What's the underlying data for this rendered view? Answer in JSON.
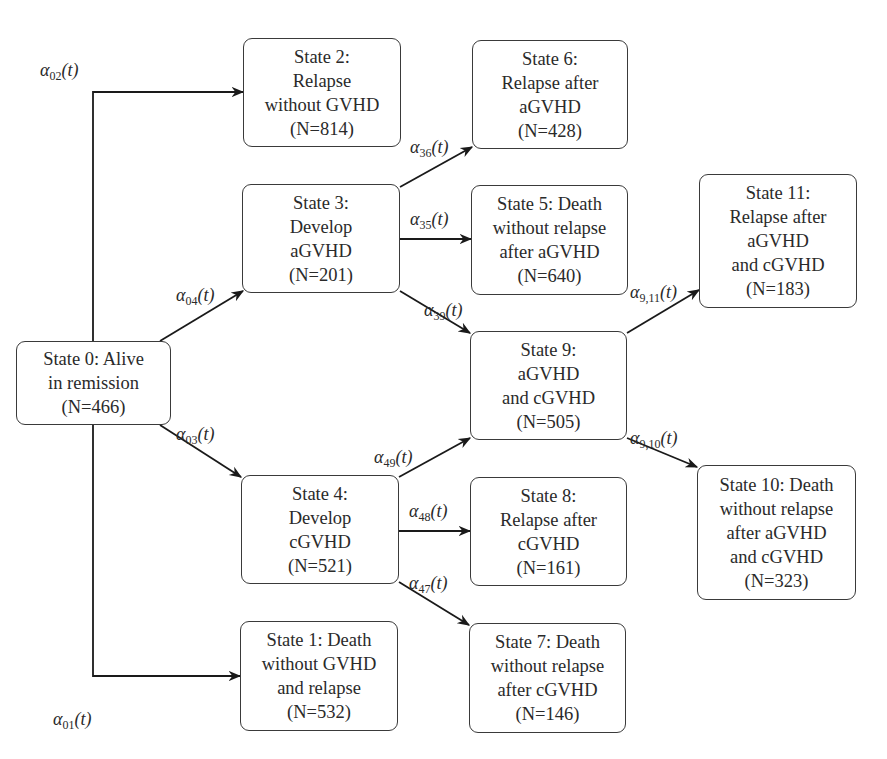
{
  "diagram": {
    "type": "multi-state transition model",
    "states": [
      {
        "id": "s0",
        "lines": [
          "State 0: Alive",
          "in remission",
          "(N=466)"
        ],
        "box": [
          16,
          341,
          155,
          84
        ]
      },
      {
        "id": "s1",
        "lines": [
          "State 1: Death",
          "without GVHD",
          "and relapse",
          "(N=532)"
        ],
        "box": [
          240,
          621,
          158,
          110
        ]
      },
      {
        "id": "s2",
        "lines": [
          "State 2:",
          "Relapse",
          "without GVHD",
          "(N=814)"
        ],
        "box": [
          243,
          38,
          158,
          109
        ]
      },
      {
        "id": "s3",
        "lines": [
          "State 3:",
          "Develop",
          "aGVHD",
          "(N=201)"
        ],
        "box": [
          242,
          184,
          158,
          109
        ]
      },
      {
        "id": "s4",
        "lines": [
          "State 4:",
          "Develop",
          "cGVHD",
          "(N=521)"
        ],
        "box": [
          241,
          475,
          158,
          109
        ]
      },
      {
        "id": "s5",
        "lines": [
          "State 5: Death",
          "without relapse",
          "after aGVHD",
          "(N=640)"
        ],
        "box": [
          471,
          185,
          157,
          110
        ]
      },
      {
        "id": "s6",
        "lines": [
          "State 6:",
          "Relapse after",
          "aGVHD",
          "(N=428)"
        ],
        "box": [
          472,
          40,
          156,
          109
        ]
      },
      {
        "id": "s7",
        "lines": [
          "State 7: Death",
          "without relapse",
          "after cGVHD",
          "(N=146)"
        ],
        "box": [
          469,
          623,
          157,
          110
        ]
      },
      {
        "id": "s8",
        "lines": [
          "State 8:",
          "Relapse after",
          "cGVHD",
          "(N=161)"
        ],
        "box": [
          470,
          477,
          157,
          109
        ]
      },
      {
        "id": "s9",
        "lines": [
          "State 9:",
          "aGVHD",
          "and cGVHD",
          "(N=505)"
        ],
        "box": [
          470,
          331,
          157,
          109
        ]
      },
      {
        "id": "s10",
        "lines": [
          "State 10: Death",
          "without relapse",
          "after aGVHD",
          "and cGVHD",
          "(N=323)"
        ],
        "box": [
          697,
          465,
          159,
          135
        ]
      },
      {
        "id": "s11",
        "lines": [
          "State 11:",
          "Relapse after",
          "aGVHD",
          "and cGVHD",
          "(N=183)"
        ],
        "box": [
          699,
          174,
          158,
          134
        ]
      }
    ],
    "transitions": [
      {
        "label": "α",
        "sub": "02",
        "from": "s0",
        "to": "s2",
        "points": [
          [
            93,
            341
          ],
          [
            93,
            92
          ],
          [
            243,
            92
          ]
        ],
        "lblpos": [
          40,
          60
        ]
      },
      {
        "label": "α",
        "sub": "01",
        "from": "s0",
        "to": "s1",
        "points": [
          [
            93,
            425
          ],
          [
            93,
            676
          ],
          [
            240,
            676
          ]
        ],
        "lblpos": [
          53,
          709
        ]
      },
      {
        "label": "α",
        "sub": "04",
        "from": "s0",
        "to": "s3",
        "points": [
          [
            160,
            341
          ],
          [
            243,
            291
          ]
        ],
        "lblpos": [
          176,
          285
        ]
      },
      {
        "label": "α",
        "sub": "03",
        "from": "s0",
        "to": "s4",
        "points": [
          [
            160,
            425
          ],
          [
            241,
            477
          ]
        ],
        "lblpos": [
          176,
          424
        ]
      },
      {
        "label": "α",
        "sub": "36",
        "from": "s3",
        "to": "s6",
        "points": [
          [
            400,
            187
          ],
          [
            472,
            147
          ]
        ],
        "lblpos": [
          410,
          137
        ]
      },
      {
        "label": "α",
        "sub": "35",
        "from": "s3",
        "to": "s5",
        "points": [
          [
            400,
            239
          ],
          [
            471,
            239
          ]
        ],
        "lblpos": [
          410,
          209
        ]
      },
      {
        "label": "α",
        "sub": "39",
        "from": "s3",
        "to": "s9",
        "points": [
          [
            400,
            291
          ],
          [
            470,
            333
          ]
        ],
        "lblpos": [
          424,
          300
        ]
      },
      {
        "label": "α",
        "sub": "49",
        "from": "s4",
        "to": "s9",
        "points": [
          [
            399,
            477
          ],
          [
            470,
            438
          ]
        ],
        "lblpos": [
          374,
          447
        ]
      },
      {
        "label": "α",
        "sub": "48",
        "from": "s4",
        "to": "s8",
        "points": [
          [
            399,
            531
          ],
          [
            470,
            531
          ]
        ],
        "lblpos": [
          409,
          501
        ]
      },
      {
        "label": "α",
        "sub": "47",
        "from": "s4",
        "to": "s7",
        "points": [
          [
            399,
            582
          ],
          [
            469,
            625
          ]
        ],
        "lblpos": [
          409,
          573
        ]
      },
      {
        "label": "α",
        "sub": "9,11",
        "from": "s9",
        "to": "s11",
        "points": [
          [
            627,
            333
          ],
          [
            699,
            290
          ]
        ],
        "lblpos": [
          630,
          282
        ]
      },
      {
        "label": "α",
        "sub": "9,10",
        "from": "s9",
        "to": "s10",
        "points": [
          [
            627,
            438
          ],
          [
            697,
            467
          ]
        ],
        "lblpos": [
          630,
          428
        ]
      }
    ],
    "function_arg": "(t)"
  }
}
